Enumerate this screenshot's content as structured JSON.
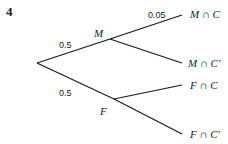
{
  "question_number": "4",
  "tree": {
    "root": {
      "x": 37,
      "y": 63
    },
    "level1": [
      {
        "node": "M",
        "prob": "0.5",
        "x": 110,
        "y": 39
      },
      {
        "node": "F",
        "prob": "0.5",
        "x": 114,
        "y": 99
      }
    ],
    "level2": [
      {
        "parent": "M",
        "outcome": "M ∩ C",
        "prob": "0.05",
        "x": 182,
        "y": 15
      },
      {
        "parent": "M",
        "outcome": "M ∩ C′",
        "prob": "",
        "x": 182,
        "y": 63
      },
      {
        "parent": "F",
        "outcome": "F ∩ C",
        "prob": "",
        "x": 182,
        "y": 85
      },
      {
        "parent": "F",
        "outcome": "F ∩ C′",
        "prob": "",
        "x": 182,
        "y": 134
      }
    ]
  },
  "colors": {
    "line": "#1a1a1a",
    "text": "#1a1a1a",
    "background": "#ffffff"
  }
}
